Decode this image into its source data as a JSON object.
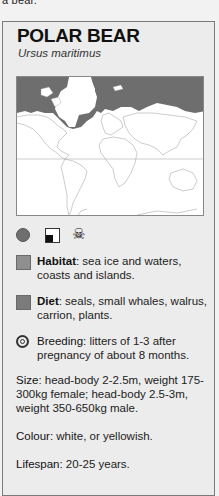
{
  "top_cut_text": "a bear.",
  "card": {
    "title": "POLAR BEAR",
    "scientific_name": "Ursus maritimus",
    "map": {
      "description": "World map (Mercator) with arctic range shaded",
      "range_color": "#6e6e6e",
      "land_color": "#ffffff"
    },
    "status_icons": [
      {
        "name": "circle",
        "color": "#6f6f6f"
      },
      {
        "name": "half-filled-square"
      },
      {
        "name": "skull-crossbones",
        "glyph": "☠"
      }
    ],
    "habitat": {
      "label": "Habitat",
      "text": ": sea ice and waters, coasts and islands.",
      "swatch_color": "#8f8f8f"
    },
    "diet": {
      "label": "Diet",
      "text": ": seals, small whales, walrus, carrion, plants.",
      "swatch_color": "#7b7b7b"
    },
    "breeding": {
      "label": "Breeding",
      "text": ": litters of 1-3 after pregnancy of about 8 months."
    },
    "size": {
      "label": "Size",
      "text": ": head-body 2-2.5m, weight 175-300kg female; head-body 2.5-3m, weight 350-650kg male."
    },
    "colour": {
      "label": "Colour",
      "text": ": white, or yellowish."
    },
    "lifespan": {
      "label": "Lifespan",
      "text": ": 20-25 years."
    }
  }
}
